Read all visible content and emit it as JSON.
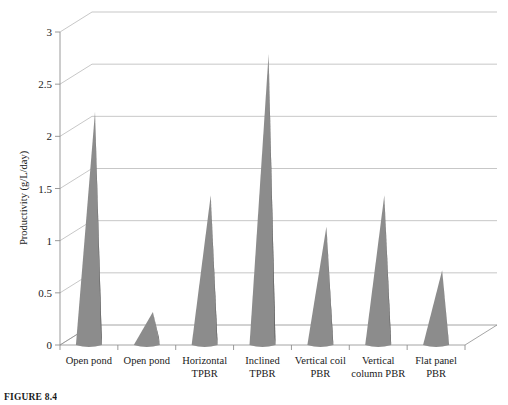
{
  "figure": {
    "caption": "FIGURE 8.4"
  },
  "chart_data": {
    "type": "bar",
    "title": "",
    "subtitle": "",
    "xlabel": "",
    "ylabel": "Productivity (g/L/day)",
    "ylim": [
      0,
      3
    ],
    "ytick_values": [
      0,
      0.5,
      1,
      1.5,
      2,
      2.5,
      3
    ],
    "ytick_labels": [
      "0",
      "0.5",
      "1",
      "1.5",
      "2",
      "2.5",
      "3"
    ],
    "grid": true,
    "legend": "none",
    "style": "3d-cone",
    "categories": [
      "Open pond",
      "Open pond",
      "Horizontal TPBR",
      "Inclined TPBR",
      "Vertical coil PBR",
      "Vertical column PBR",
      "Flat panel PBR"
    ],
    "category_lines": [
      [
        "Open pond"
      ],
      [
        "Open pond"
      ],
      [
        "Horizontal",
        "TPBR"
      ],
      [
        "Inclined",
        "TPBR"
      ],
      [
        "Vertical coil",
        "PBR"
      ],
      [
        "Vertical",
        "column PBR"
      ],
      [
        "Flat panel",
        "PBR"
      ]
    ],
    "values": [
      2.2,
      0.28,
      1.4,
      2.75,
      1.1,
      1.4,
      0.68
    ],
    "colors": {
      "cone_light": "#8c8c8c",
      "cone_dark": "#575757",
      "grid": "#b9b9b9",
      "axis": "#8e8e8e",
      "text": "#1a1a1a",
      "background": "#ffffff"
    }
  }
}
